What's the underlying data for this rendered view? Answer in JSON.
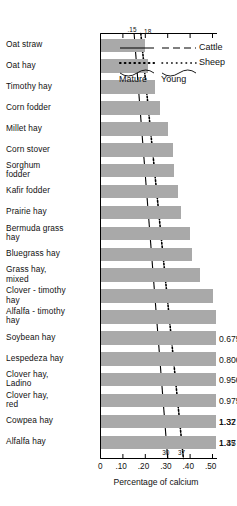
{
  "chart_data": {
    "type": "bar",
    "orientation": "horizontal",
    "title": "",
    "xlabel": "Percentage of calcium",
    "ylabel": "",
    "xlim": [
      0,
      0.5
    ],
    "xticks": [
      0,
      0.1,
      0.2,
      0.3,
      0.4,
      0.5
    ],
    "xtick_labels": [
      "0",
      ".10",
      ".20",
      ".30",
      ".40",
      ".50"
    ],
    "grid": false,
    "legend_position": "top-right",
    "categories": [
      "Oat straw",
      "Oat hay",
      "Timothy  hay",
      "Corn  fodder",
      "Millet  hay",
      "Corn stover",
      "Sorghum\nfodder",
      "Kafir fodder",
      "Prairie  hay",
      "Bermuda grass\nhay",
      "Bluegrass  hay",
      "Grass hay,\nmixed",
      "Clover - timothy\nhay",
      "Alfalfa - timothy\nhay",
      "Soybean hay",
      "Lespedeza hay",
      "Clover hay,\n Ladino",
      "Clover hay,\n red",
      "Cowpea hay",
      "Alfalfa hay"
    ],
    "values": [
      0.2,
      0.21,
      0.245,
      0.265,
      0.3,
      0.325,
      0.33,
      0.345,
      0.36,
      0.4,
      0.41,
      0.445,
      0.5,
      0.53,
      0.675,
      0.8,
      0.95,
      0.975,
      1.32,
      1.35
    ],
    "value_labels": [
      "",
      "",
      "",
      "",
      "",
      "",
      "",
      "",
      "",
      "",
      "",
      "",
      "",
      "",
      "0.675",
      "0.800",
      "0.950",
      "0.975",
      "1.32",
      "1.35"
    ],
    "extra_value_labels": [
      "1.37",
      "1.47"
    ],
    "reference_lines": [
      {
        "name": "Cattle",
        "style": "solid-dashed",
        "top_value": 0.15,
        "bottom_value": 0.3
      },
      {
        "name": "Sheep",
        "style": "dotted",
        "top_value": 0.18,
        "bottom_value": 0.37
      }
    ],
    "annotations_top": [
      ".15",
      ".18"
    ],
    "annotations_bottom": [
      "30",
      "37"
    ],
    "bar_color": "#a9a9a9"
  },
  "legend": {
    "cattle_label": "Cattle",
    "sheep_label": "Sheep",
    "mature_label": "Mature",
    "young_label": "Young"
  },
  "axis": {
    "title": "Percentage of calcium",
    "tick_0": "0",
    "tick_10": ".10",
    "tick_20": ".20",
    "tick_30": ".30",
    "tick_40": ".40",
    "tick_50": ".50"
  },
  "rows": [
    {
      "label": "Oat straw",
      "value_label": ""
    },
    {
      "label": "Oat hay",
      "value_label": ""
    },
    {
      "label": "Timothy  hay",
      "value_label": ""
    },
    {
      "label": "Corn  fodder",
      "value_label": ""
    },
    {
      "label": "Millet  hay",
      "value_label": ""
    },
    {
      "label": "Corn stover",
      "value_label": ""
    },
    {
      "label": "Sorghum\nfodder",
      "value_label": ""
    },
    {
      "label": "Kafir fodder",
      "value_label": ""
    },
    {
      "label": "Prairie  hay",
      "value_label": ""
    },
    {
      "label": "Bermuda grass\nhay",
      "value_label": ""
    },
    {
      "label": "Bluegrass  hay",
      "value_label": ""
    },
    {
      "label": "Grass hay,\nmixed",
      "value_label": ""
    },
    {
      "label": "Clover - timothy\nhay",
      "value_label": ""
    },
    {
      "label": "Alfalfa - timothy\nhay",
      "value_label": ""
    },
    {
      "label": "Soybean hay",
      "value_label": "0.675"
    },
    {
      "label": "Lespedeza hay",
      "value_label": "0.800"
    },
    {
      "label": "Clover hay,\n Ladino",
      "value_label": "0.950"
    },
    {
      "label": "Clover hay,\n red",
      "value_label": "0.975"
    },
    {
      "label": "Cowpea hay",
      "value_label": "1.32"
    },
    {
      "label": "Alfalfa hay",
      "value_label": "1.35"
    }
  ],
  "annotations": {
    "top_left": ".15",
    "top_right": ".18",
    "bottom_left": "30",
    "bottom_right": "37"
  }
}
